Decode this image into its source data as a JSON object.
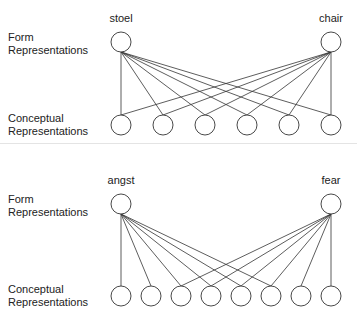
{
  "panels": [
    {
      "form_label": "Form Representations",
      "form_label_lines": [
        "Form",
        "Representations"
      ],
      "conceptual_label_lines": [
        "Conceptual",
        "Representations"
      ],
      "words": [
        "stoel",
        "chair"
      ],
      "form_nodes": [
        {
          "x": 121,
          "y": 42
        },
        {
          "x": 331,
          "y": 42
        }
      ],
      "concept_y": 125,
      "concept_nodes_x": [
        121,
        163,
        205,
        247,
        289,
        331
      ],
      "links": {
        "0": [
          0,
          1,
          2,
          3,
          4,
          5
        ],
        "1": [
          0,
          1,
          2,
          3,
          4,
          5
        ]
      }
    },
    {
      "form_label_lines": [
        "Form",
        "Representations"
      ],
      "conceptual_label_lines": [
        "Conceptual",
        "Representations"
      ],
      "words": [
        "angst",
        "fear"
      ],
      "form_nodes": [
        {
          "x": 121,
          "y": 204
        },
        {
          "x": 331,
          "y": 204
        }
      ],
      "concept_y": 296,
      "concept_nodes_x": [
        121,
        151,
        181,
        211,
        241,
        271,
        301,
        331
      ],
      "links": {
        "0": [
          0,
          1,
          2,
          3,
          4,
          5
        ],
        "1": [
          2,
          3,
          4,
          5,
          6,
          7
        ]
      }
    }
  ],
  "style": {
    "stroke": "#333333",
    "node_radius": 10
  }
}
